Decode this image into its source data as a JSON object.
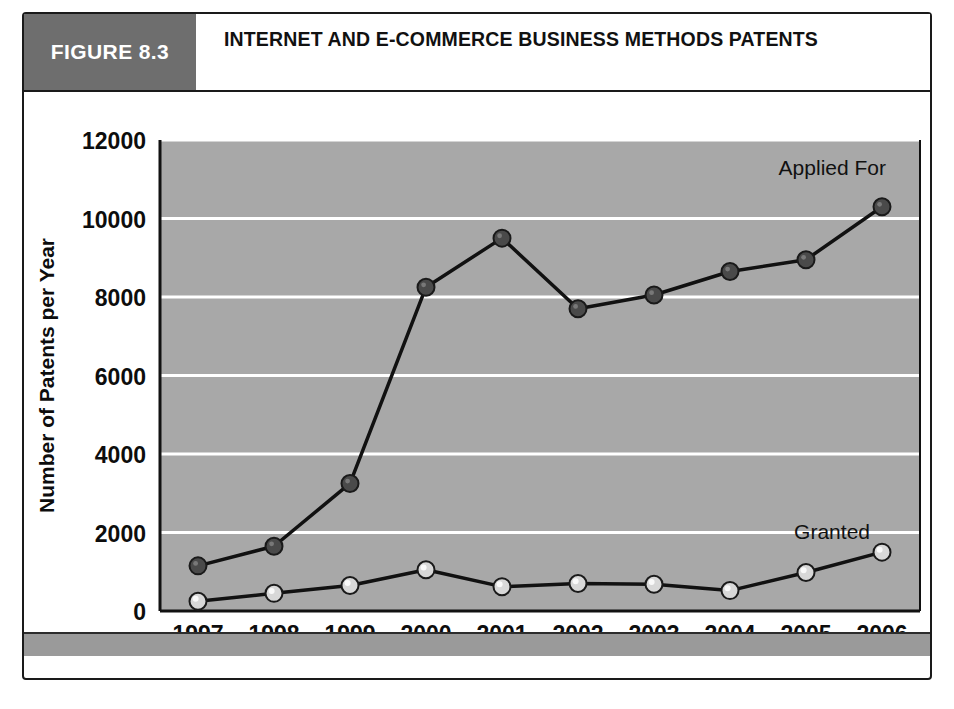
{
  "figure": {
    "tag": "FIGURE 8.3",
    "title": "INTERNET AND E-COMMERCE BUSINESS METHODS PATENTS"
  },
  "chart_data": {
    "type": "line",
    "title": "Internet and E-Commerce Business Methods Patents",
    "xlabel": "Year",
    "ylabel": "Number of Patents per Year",
    "categories": [
      "1997",
      "1998",
      "1999",
      "2000",
      "2001",
      "2002",
      "2003",
      "2004",
      "2005",
      "2006"
    ],
    "x": [
      1997,
      1998,
      1999,
      2000,
      2001,
      2002,
      2003,
      2004,
      2005,
      2006
    ],
    "ylim": [
      0,
      12000
    ],
    "yticks": [
      0,
      2000,
      4000,
      6000,
      8000,
      10000,
      12000
    ],
    "ytick_labels": [
      "0",
      "2000",
      "4000",
      "6000",
      "8000",
      "10000",
      "12000"
    ],
    "grid": "horizontal",
    "legend": "inline-annotations",
    "plot_background": "#a8a8a8",
    "series": [
      {
        "name": "Applied For",
        "marker": "circle",
        "marker_color": "#4a4a4a",
        "line_color": "#111111",
        "label_position": "upper-right",
        "values": [
          1150,
          1650,
          3250,
          8250,
          9500,
          7700,
          8050,
          8650,
          8950,
          10300
        ]
      },
      {
        "name": "Granted",
        "marker": "circle",
        "marker_color": "#d8d8d8",
        "line_color": "#111111",
        "label_position": "lower-right",
        "values": [
          250,
          450,
          650,
          1050,
          620,
          700,
          680,
          520,
          980,
          1500
        ]
      }
    ],
    "annotations": [
      {
        "text": "Applied For",
        "series": "Applied For"
      },
      {
        "text": "Granted",
        "series": "Granted"
      }
    ]
  },
  "colors": {
    "figure_tag_bg": "#6e6e6e",
    "plot_bg": "#a8a8a8",
    "gridline": "#ffffff",
    "footer_bar": "#9a9a9a",
    "frame_border": "#1a1a1a"
  }
}
